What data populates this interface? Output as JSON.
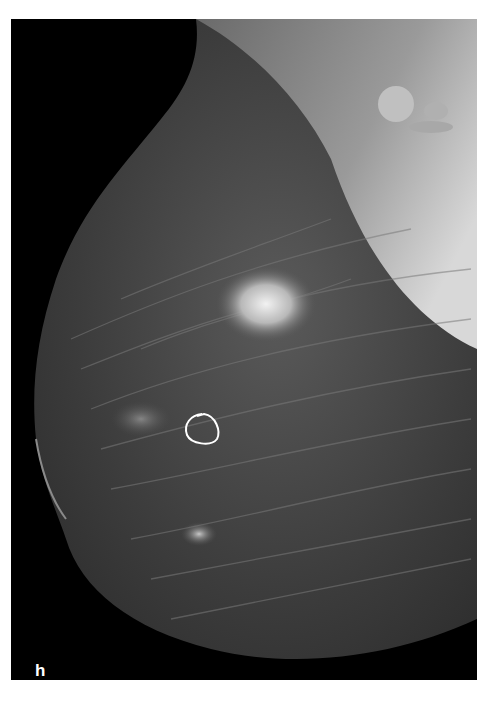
{
  "image": {
    "type": "mammogram",
    "panel_label": "h",
    "laterality": "R",
    "view": "MLO",
    "annotations": [
      {
        "shape": "outline-loop",
        "color": "#ffffff",
        "location": "lower-left mid-breast"
      }
    ]
  }
}
